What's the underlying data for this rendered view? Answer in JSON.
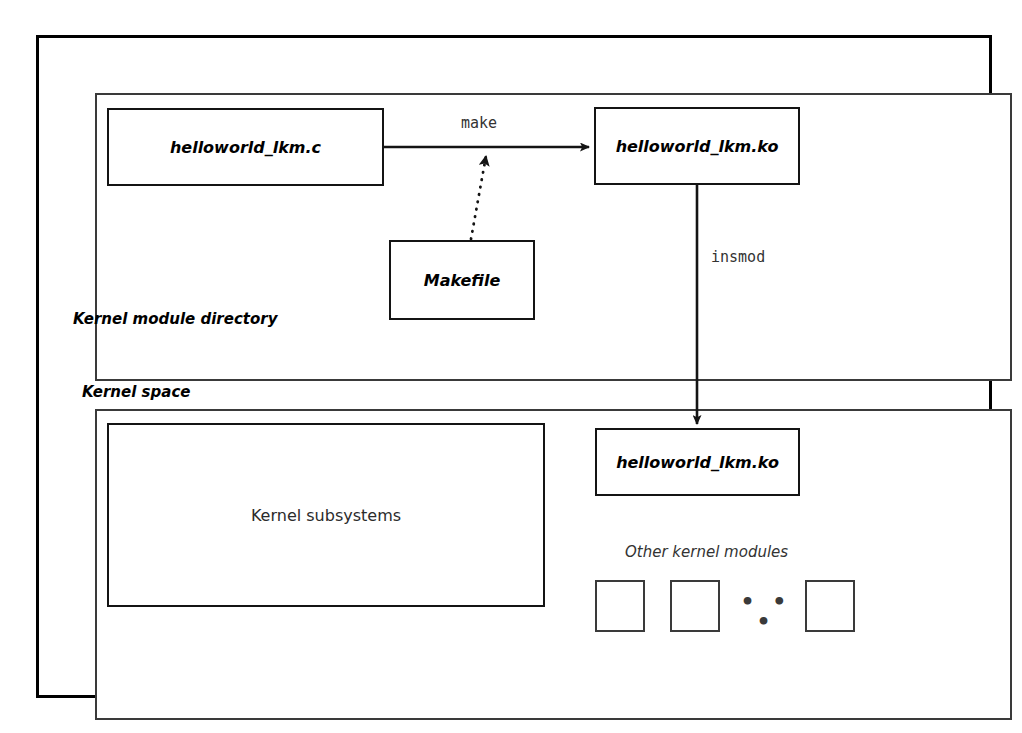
{
  "diagram": {
    "colors": {
      "stroke": "#141414",
      "frame": "#3a3a3a",
      "background": "#ffffff",
      "text": "#000000",
      "label_text": "#333333"
    },
    "outer_frame": {
      "name": "diagram-outer-frame"
    },
    "sections": [
      {
        "id": "kernel-module-directory",
        "label": "Kernel module directory"
      },
      {
        "id": "kernel-space",
        "label": "Kernel space"
      }
    ],
    "nodes": [
      {
        "id": "source-c",
        "label": "helloworld_lkm.c",
        "style": "bold-italic",
        "section": "kernel-module-directory"
      },
      {
        "id": "makefile",
        "label": "Makefile",
        "style": "bold-italic",
        "section": "kernel-module-directory"
      },
      {
        "id": "ko-built",
        "label": "helloworld_lkm.ko",
        "style": "bold-italic",
        "section": "kernel-module-directory"
      },
      {
        "id": "subsystems",
        "label": "Kernel subsystems",
        "style": "plain",
        "section": "kernel-space"
      },
      {
        "id": "ko-loaded",
        "label": "helloworld_lkm.ko",
        "style": "bold-italic",
        "section": "kernel-space"
      }
    ],
    "edges": [
      {
        "id": "make-edge",
        "label": "make",
        "from": "source-c",
        "to": "ko-built",
        "line": "solid",
        "arrow": "end"
      },
      {
        "id": "makefile-edge",
        "label": "",
        "from": "makefile",
        "to": "make-edge",
        "line": "dotted",
        "arrow": "end"
      },
      {
        "id": "insmod-edge",
        "label": "insmod",
        "from": "ko-built",
        "to": "ko-loaded",
        "line": "solid",
        "arrow": "end"
      }
    ],
    "other_modules": {
      "label": "Other kernel modules",
      "ellipsis": "• • •",
      "squares": [
        {
          "id": "module-square-1"
        },
        {
          "id": "module-square-2"
        },
        {
          "id": "module-square-3"
        }
      ]
    }
  }
}
